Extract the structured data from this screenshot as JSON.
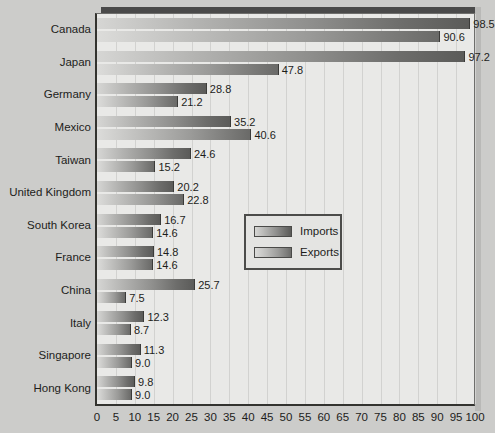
{
  "chart_data": {
    "type": "bar",
    "orientation": "horizontal",
    "title": "",
    "subtitle": "",
    "xlabel": "",
    "ylabel": "",
    "xlim": [
      0,
      100
    ],
    "xticks": [
      "0",
      "5",
      "10",
      "15",
      "20",
      "25",
      "30",
      "35",
      "40",
      "45",
      "50",
      "55",
      "60",
      "65",
      "70",
      "75",
      "80",
      "85",
      "90",
      "95",
      "100"
    ],
    "grid": true,
    "legend_position": "center-right",
    "categories": [
      "Canada",
      "Japan",
      "Germany",
      "Mexico",
      "Taiwan",
      "United Kingdom",
      "South Korea",
      "France",
      "China",
      "Italy",
      "Singapore",
      "Hong Kong"
    ],
    "series": [
      {
        "name": "Imports",
        "values": [
          98.5,
          97.2,
          28.8,
          35.2,
          24.6,
          20.2,
          16.7,
          14.8,
          25.7,
          12.3,
          11.3,
          9.8
        ],
        "labels": [
          "98.5",
          "97.2",
          "28.8",
          "35.2",
          "24.6",
          "20.2",
          "16.7",
          "14.8",
          "25.7",
          "12.3",
          "11.3",
          "9.8"
        ]
      },
      {
        "name": "Exports",
        "values": [
          90.6,
          47.8,
          21.2,
          40.6,
          15.2,
          22.8,
          14.6,
          14.6,
          7.5,
          8.7,
          9.0,
          9.0
        ],
        "labels": [
          "90.6",
          "47.8",
          "21.2",
          "40.6",
          "15.2",
          "22.8",
          "14.6",
          "14.6",
          "7.5",
          "8.7",
          "9.0",
          "9.0"
        ]
      }
    ]
  },
  "legend": {
    "items": [
      {
        "label": "Imports",
        "swatch": "imports-swatch"
      },
      {
        "label": "Exports",
        "swatch": "exports-swatch"
      }
    ]
  },
  "colors": {
    "background": "#ccccca",
    "plot_background": "#e9e9e7",
    "axis": "#33332f",
    "gridline": "#d2d2d0",
    "bar_light": "#d6d6d4",
    "bar_dark": "#5b5b59",
    "text": "#1d1d1b",
    "top_shadow": "#4a4a4a"
  }
}
